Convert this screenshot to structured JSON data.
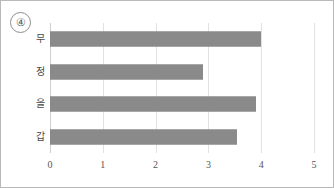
{
  "figure": {
    "marker_label": "④",
    "border_color": "#b9b9b9",
    "background": "#ffffff"
  },
  "chart_data": {
    "type": "bar",
    "orientation": "horizontal",
    "title": "",
    "subtitle": "",
    "xlabel": "",
    "ylabel": "",
    "categories": [
      "갑",
      "을",
      "정",
      "무"
    ],
    "values": [
      3.55,
      3.9,
      2.9,
      4.0
    ],
    "series": [
      {
        "name": "",
        "values": [
          3.55,
          3.9,
          2.9,
          4.0
        ]
      }
    ],
    "xlim": [
      0,
      5
    ],
    "ylim": null,
    "xticks": [
      "0",
      "1",
      "2",
      "3",
      "4",
      "5"
    ],
    "xtick_values": [
      0,
      1,
      2,
      3,
      4,
      5
    ],
    "grid": true,
    "grid_axis": "x",
    "legend": false,
    "legend_position": "none",
    "bar_color": "#8a8a8a",
    "grid_color": "#e2e2e2",
    "tick_label_color": "#555555",
    "category_label_color": "#4a4a4a",
    "bars_top_to_bottom": [
      {
        "category": "무",
        "value": 4.0
      },
      {
        "category": "정",
        "value": 2.9
      },
      {
        "category": "을",
        "value": 3.9
      },
      {
        "category": "갑",
        "value": 3.55
      }
    ]
  }
}
